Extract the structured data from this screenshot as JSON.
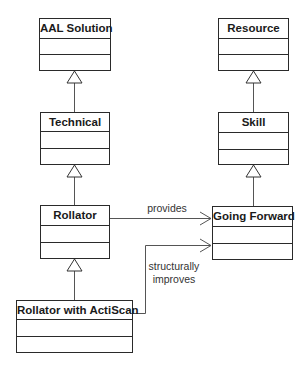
{
  "diagram": {
    "type": "uml-class-diagram",
    "classes": [
      {
        "id": "aal-solution",
        "name": "AAL Solution"
      },
      {
        "id": "technical",
        "name": "Technical"
      },
      {
        "id": "rollator",
        "name": "Rollator"
      },
      {
        "id": "rollator-actiscan",
        "name": "Rollator with ActiScan"
      },
      {
        "id": "resource",
        "name": "Resource"
      },
      {
        "id": "skill",
        "name": "Skill"
      },
      {
        "id": "going-forward",
        "name": "Going Forward"
      }
    ],
    "generalizations": [
      {
        "from": "Technical",
        "to": "AAL Solution"
      },
      {
        "from": "Rollator",
        "to": "Technical"
      },
      {
        "from": "Rollator with ActiScan",
        "to": "Rollator"
      },
      {
        "from": "Skill",
        "to": "Resource"
      },
      {
        "from": "Going Forward",
        "to": "Skill"
      }
    ],
    "associations": [
      {
        "from": "Rollator",
        "to": "Going Forward",
        "label": "provides"
      },
      {
        "from": "Rollator with ActiScan",
        "to": "Going Forward",
        "label_line1": "structurally",
        "label_line2": "improves"
      }
    ]
  }
}
